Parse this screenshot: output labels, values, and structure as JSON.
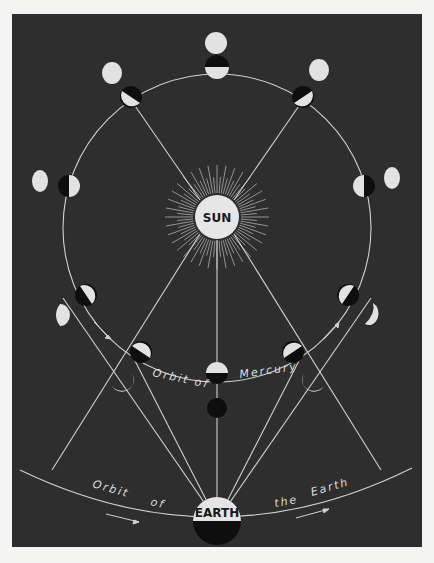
{
  "diagram": {
    "type": "astronomical diagram",
    "labels": {
      "sun": "SUN",
      "earth": "EARTH",
      "mercury_orbit_1": "Orbit of",
      "mercury_orbit_2": "Mercury",
      "earth_orbit_1": "Orbit",
      "earth_orbit_2": "of",
      "earth_orbit_3": "the",
      "earth_orbit_4": "Earth"
    },
    "colors": {
      "background": "#2e2e2e",
      "paper": "#f4f4f2",
      "lit": "#e2e2e2",
      "dark": "#0e0e0e",
      "line": "#cfcfcf"
    }
  }
}
